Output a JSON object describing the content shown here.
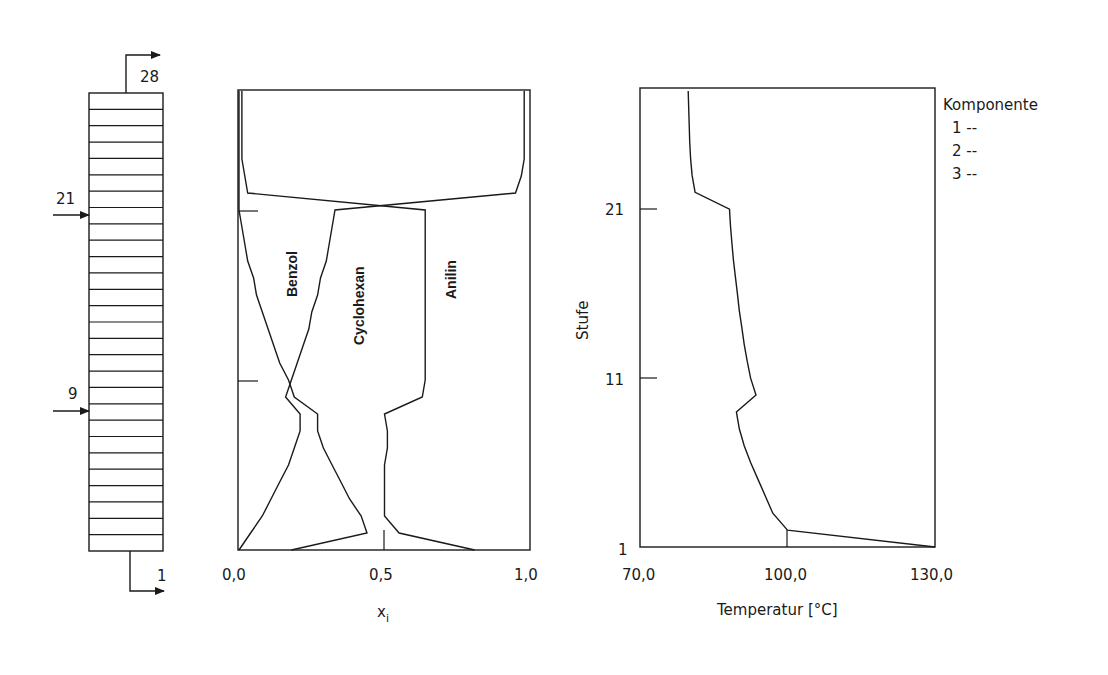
{
  "column": {
    "trays": 28,
    "top_label": "28",
    "bottom_label": "1",
    "feeds": [
      {
        "stage": 21,
        "label": "21"
      },
      {
        "stage": 9,
        "label": "9"
      }
    ]
  },
  "chart_data": [
    {
      "type": "line",
      "title": "",
      "xlabel": "x_i",
      "ylabel": "",
      "xlim": [
        0.0,
        1.0
      ],
      "ylim": [
        1,
        28
      ],
      "x_ticks": [
        "0,0",
        "0,5",
        "1,0"
      ],
      "y_ticks_marks": [
        11,
        21
      ],
      "grid": false,
      "stages": [
        1,
        2,
        3,
        4,
        5,
        6,
        7,
        8,
        9,
        10,
        11,
        12,
        13,
        14,
        15,
        16,
        17,
        18,
        19,
        20,
        21,
        22,
        23,
        24,
        25,
        26,
        27,
        28
      ],
      "series": [
        {
          "name": "Benzol",
          "values": [
            0.18,
            0.44,
            0.42,
            0.38,
            0.35,
            0.32,
            0.29,
            0.27,
            0.27,
            0.19,
            0.17,
            0.14,
            0.12,
            0.1,
            0.08,
            0.06,
            0.05,
            0.03,
            0.02,
            0.01,
            0.0,
            0.0,
            0.0,
            0.0,
            0.0,
            0.0,
            0.0,
            0.0
          ]
        },
        {
          "name": "Cyclohexan",
          "values": [
            0.0,
            0.04,
            0.08,
            0.11,
            0.14,
            0.17,
            0.19,
            0.21,
            0.21,
            0.16,
            0.18,
            0.2,
            0.22,
            0.24,
            0.25,
            0.27,
            0.28,
            0.3,
            0.31,
            0.32,
            0.33,
            0.95,
            0.97,
            0.98,
            0.98,
            0.98,
            0.98,
            0.98
          ]
        },
        {
          "name": "Anilin",
          "values": [
            0.81,
            0.55,
            0.5,
            0.5,
            0.5,
            0.5,
            0.51,
            0.51,
            0.5,
            0.63,
            0.64,
            0.64,
            0.64,
            0.64,
            0.64,
            0.64,
            0.64,
            0.64,
            0.64,
            0.64,
            0.64,
            0.03,
            0.02,
            0.01,
            0.01,
            0.01,
            0.01,
            0.01
          ]
        }
      ],
      "annotations": [
        "Benzol",
        "Cyclohexan",
        "Anilin"
      ]
    },
    {
      "type": "line",
      "title": "",
      "xlabel": "Temperatur [°C]",
      "ylabel": "Stufe",
      "xlim": [
        70.0,
        130.0
      ],
      "ylim": [
        1,
        28
      ],
      "x_ticks": [
        "70,0",
        "100,0",
        "130,0"
      ],
      "y_ticks": [
        "1",
        "11",
        "21"
      ],
      "grid": false,
      "stages": [
        1,
        2,
        3,
        4,
        5,
        6,
        7,
        8,
        9,
        10,
        11,
        12,
        13,
        14,
        15,
        16,
        17,
        18,
        19,
        20,
        21,
        22,
        23,
        24,
        25,
        26,
        27,
        28
      ],
      "series": [
        {
          "name": "Temperatur",
          "values": [
            130.0,
            100.0,
            97.0,
            95.5,
            94.0,
            92.5,
            91.2,
            90.2,
            89.6,
            93.6,
            92.5,
            91.8,
            91.2,
            90.7,
            90.2,
            89.8,
            89.4,
            89.0,
            88.7,
            88.4,
            88.2,
            81.2,
            80.6,
            80.3,
            80.1,
            80.0,
            79.9,
            79.8
          ]
        }
      ],
      "legend": {
        "title": "Komponente",
        "entries": [
          {
            "label": "1",
            "style": "--"
          },
          {
            "label": "2",
            "style": "--"
          },
          {
            "label": "3",
            "style": "--"
          }
        ],
        "position": "right"
      }
    }
  ],
  "labels": {
    "x1_tick0": "0,0",
    "x1_tick1": "0,5",
    "x1_tick2": "1,0",
    "x1_axis": "x",
    "x1_axis_sub": "i",
    "x2_tick0": "70,0",
    "x2_tick1": "100,0",
    "x2_tick2": "130,0",
    "x2_axis": "Temperatur [°C]",
    "y2_axis": "Stufe",
    "y2_tick1": "1",
    "y2_tick11": "11",
    "y2_tick21": "21",
    "benzol": "Benzol",
    "cyclohexan": "Cyclohexan",
    "anilin": "Anilin",
    "legend_title": "Komponente",
    "legend_1": "1 --",
    "legend_2": "2 --",
    "legend_3": "3 --"
  }
}
